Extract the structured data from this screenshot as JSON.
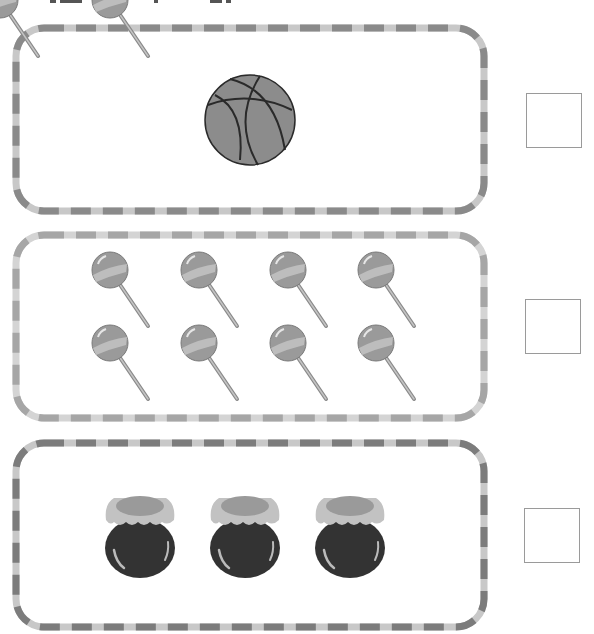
{
  "worksheet": {
    "header_fragment": "cropped instruction text (illegible)",
    "colors": {
      "border_dark": "#8a8a8a",
      "border_light": "#c8c8c8",
      "ball_fill": "#8c8c8c",
      "ball_lines": "#2a2a2a",
      "lollipop_head": "#9a9a9a",
      "lollipop_stripe": "#bdbdbd",
      "jar_body": "#333333",
      "jar_cloth": "#c2c2c2",
      "jar_lid": "#9a9a9a",
      "answer_box_border": "#9a9a9a"
    },
    "rows": [
      {
        "name": "basketball",
        "count": 1,
        "answer": ""
      },
      {
        "name": "lollipop",
        "count": 8,
        "answer": ""
      },
      {
        "name": "honey-jar",
        "count": 3,
        "answer": ""
      }
    ]
  }
}
